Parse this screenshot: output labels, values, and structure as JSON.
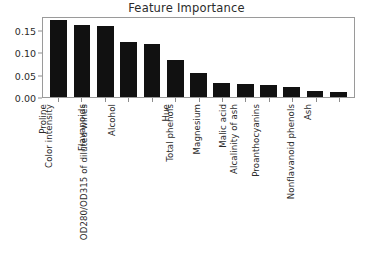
{
  "chart_data": {
    "type": "bar",
    "title": "Feature Importance",
    "xlabel": "",
    "ylabel": "",
    "ylim": [
      0.0,
      0.18
    ],
    "yticks": [
      "0.00",
      "0.05",
      "0.10",
      "0.15"
    ],
    "ytick_values": [
      0.0,
      0.05,
      0.1,
      0.15
    ],
    "grid": false,
    "legend": null,
    "bar_color": "#111111",
    "categories": [
      "Proline",
      "Color intensity",
      "Flavanoids",
      "Alcohol",
      "OD280/OD315 of diluted wines",
      "Hue",
      "Total phenols",
      "Magnesium",
      "Malic acid",
      "Alcalinity of ash",
      "Proanthocyanins",
      "Ash",
      "Nonflavanoid phenols"
    ],
    "values": [
      0.172,
      0.159,
      0.158,
      0.122,
      0.117,
      0.082,
      0.053,
      0.031,
      0.03,
      0.027,
      0.022,
      0.014,
      0.011
    ]
  },
  "caption": {
    "text": ""
  }
}
